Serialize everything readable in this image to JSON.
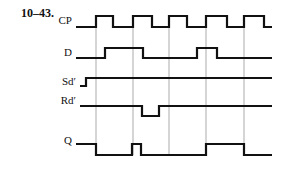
{
  "problem_number": "10–43.",
  "signals": [
    {
      "name": "CP",
      "label_y": 20,
      "high": 16,
      "low": 27,
      "points": [
        [
          76,
          "L"
        ],
        [
          96,
          "H"
        ],
        [
          113,
          "L"
        ],
        [
          133,
          "H"
        ],
        [
          152,
          "L"
        ],
        [
          169,
          "H"
        ],
        [
          187,
          "L"
        ],
        [
          206,
          "H"
        ],
        [
          227,
          "L"
        ],
        [
          244,
          "H"
        ],
        [
          264,
          "L"
        ],
        [
          272,
          "L"
        ]
      ]
    },
    {
      "name": "D",
      "label_y": 52,
      "high": 48,
      "low": 58,
      "points": [
        [
          76,
          "L"
        ],
        [
          105,
          "H"
        ],
        [
          143,
          "L"
        ],
        [
          197,
          "H"
        ],
        [
          217,
          "L"
        ],
        [
          272,
          "L"
        ]
      ]
    },
    {
      "name": "Sd′",
      "label_y": 81,
      "high": 78,
      "low": 86,
      "points": [
        [
          80,
          "L"
        ],
        [
          86,
          "H"
        ],
        [
          272,
          "H"
        ]
      ]
    },
    {
      "name": "Rd′",
      "label_y": 100,
      "high": 106,
      "low": 116,
      "points": [
        [
          80,
          "H"
        ],
        [
          142,
          "L"
        ],
        [
          159,
          "H"
        ],
        [
          272,
          "H"
        ]
      ]
    },
    {
      "name": "Q",
      "label_y": 140,
      "high": 144,
      "low": 155,
      "points": [
        [
          76,
          "H"
        ],
        [
          96,
          "L"
        ],
        [
          132,
          "H"
        ],
        [
          141,
          "L"
        ],
        [
          206,
          "H"
        ],
        [
          244,
          "L"
        ],
        [
          272,
          "L"
        ]
      ]
    }
  ],
  "clock_edge_lines": [
    96,
    133,
    169,
    206,
    244
  ],
  "line_top": 16,
  "line_bottom": 155,
  "colors": {
    "waveform": "#111111",
    "guide": "#888888"
  }
}
